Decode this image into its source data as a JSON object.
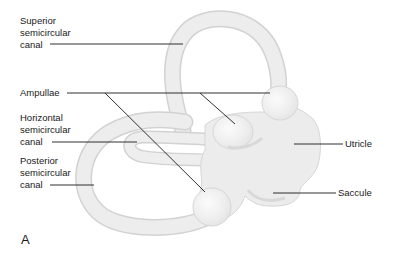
{
  "figure": {
    "panel_letter": "A",
    "colors": {
      "structure_fill": "#ececec",
      "structure_edge": "#d4d4d4",
      "highlight": "#f8f8f8",
      "shadow": "#dcdcdc",
      "leader_line": "#1a1a1a",
      "text": "#1a1a1a"
    }
  },
  "labels": {
    "superior": [
      "Superior",
      "semicircular",
      "canal"
    ],
    "ampullae": "Ampullae",
    "horizontal": [
      "Horizontal",
      "semicircular",
      "canal"
    ],
    "posterior": [
      "Posterior",
      "semicircular",
      "canal"
    ],
    "utricle": "Utricle",
    "saccule": "Saccule"
  }
}
